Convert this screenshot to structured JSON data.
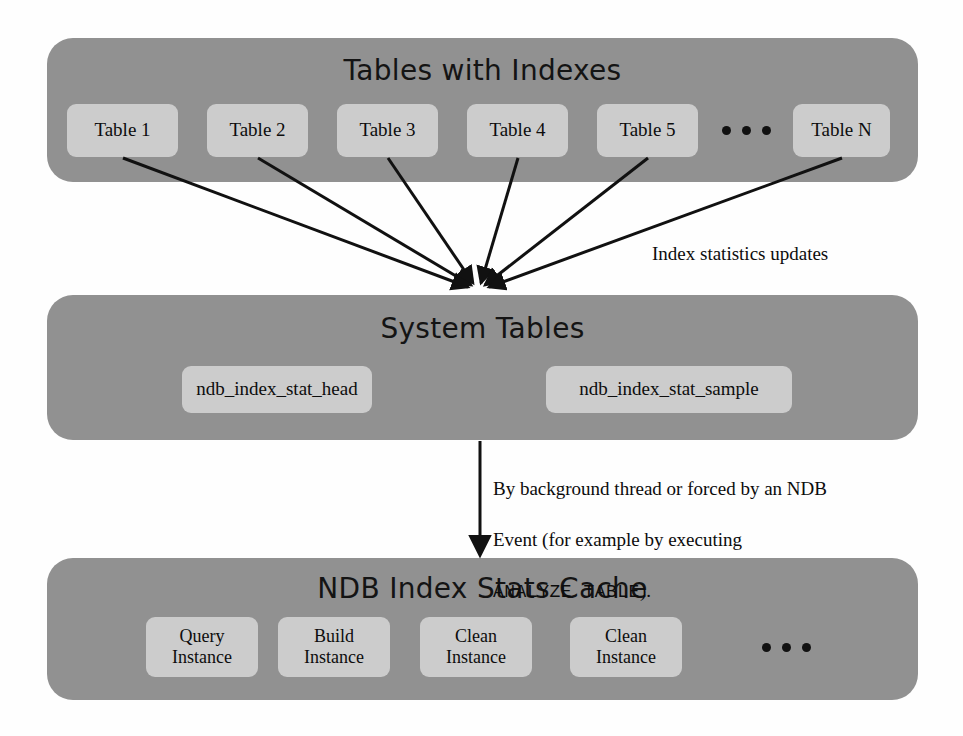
{
  "diagram": {
    "title_font_color": "#141414",
    "panel_color": "#919191",
    "box_color": "#cccccc",
    "arrow_color": "#111111",
    "background": "#fefefe"
  },
  "panels": [
    {
      "id": "tables-with-indexes",
      "title": "Tables with Indexes",
      "boxes": [
        {
          "label": "Table 1"
        },
        {
          "label": "Table 2"
        },
        {
          "label": "Table 3"
        },
        {
          "label": "Table 4"
        },
        {
          "label": "Table 5"
        },
        {
          "label": "Table N"
        }
      ],
      "ellipsis": "• • •"
    },
    {
      "id": "system-tables",
      "title": "System Tables",
      "boxes": [
        {
          "label": "ndb_index_stat_head"
        },
        {
          "label": "ndb_index_stat_sample"
        }
      ]
    },
    {
      "id": "ndb-index-stats-cache",
      "title": "NDB Index Stats Cache",
      "boxes": [
        {
          "line1": "Query",
          "line2": "Instance"
        },
        {
          "line1": "Build",
          "line2": "Instance"
        },
        {
          "line1": "Clean",
          "line2": "Instance"
        },
        {
          "line1": "Clean",
          "line2": "Instance"
        }
      ],
      "ellipsis": "• • •"
    }
  ],
  "annotations": {
    "index_stats_updates": "Index statistics updates",
    "background_thread_line1": "By background thread or forced by an NDB",
    "background_thread_line2": "Event (for example by executing",
    "background_thread_code": "ANALYZE TABLE",
    "background_thread_tail": ")."
  }
}
